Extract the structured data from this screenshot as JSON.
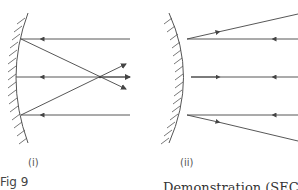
{
  "figure": {
    "label": "Fig 9",
    "caption_fragment": "Demonstration (SEC 100",
    "line_color": "#444444"
  },
  "panels": [
    {
      "id": "i",
      "label": "(i)",
      "mirror_type": "concave",
      "description": "Parallel rays incident from right reflect and converge at focus",
      "rays_y": [
        39,
        77,
        115
      ]
    },
    {
      "id": "ii",
      "label": "(ii)",
      "mirror_type": "convex",
      "description": "Parallel rays incident from right reflect and diverge",
      "rays_y": [
        39,
        77,
        115
      ]
    }
  ]
}
